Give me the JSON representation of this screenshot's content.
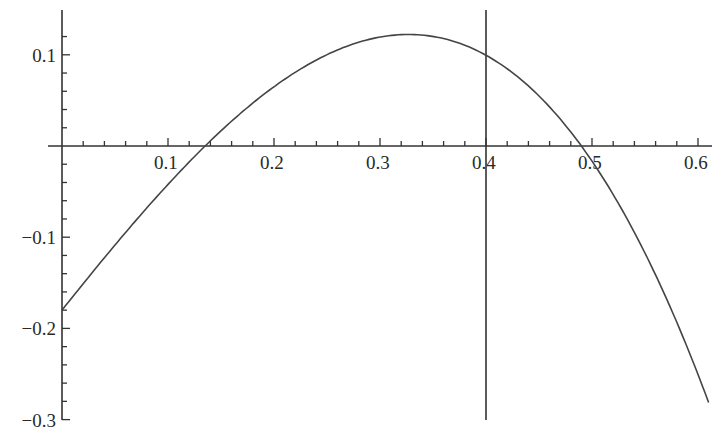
{
  "chart_data": {
    "type": "line",
    "title": "",
    "xlabel": "",
    "ylabel": "",
    "xlim": [
      0,
      0.61
    ],
    "ylim": [
      -0.3,
      0.13
    ],
    "grid": false,
    "legend": null,
    "x_ticks": [
      {
        "value": 0.1,
        "label": "0.1"
      },
      {
        "value": 0.2,
        "label": "0.2"
      },
      {
        "value": 0.3,
        "label": "0.3"
      },
      {
        "value": 0.4,
        "label": "0.4"
      },
      {
        "value": 0.5,
        "label": "0.5"
      },
      {
        "value": 0.6,
        "label": "0.6"
      }
    ],
    "y_ticks": [
      {
        "value": 0.1,
        "label": "0.1"
      },
      {
        "value": -0.1,
        "label": "−0.1"
      },
      {
        "value": -0.2,
        "label": "−0.2"
      },
      {
        "value": -0.3,
        "label": "−0.3"
      }
    ],
    "x_minor_step": 0.02,
    "y_minor_step": 0.02,
    "series": [
      {
        "name": "f(x)",
        "x": [
          0.0,
          0.05,
          0.1,
          0.135,
          0.15,
          0.2,
          0.25,
          0.3,
          0.32,
          0.35,
          0.4,
          0.45,
          0.49,
          0.5,
          0.55,
          0.61
        ],
        "values": [
          -0.18,
          -0.115,
          -0.055,
          0.0,
          0.015,
          0.062,
          0.092,
          0.104,
          0.105,
          0.103,
          0.088,
          0.05,
          0.0,
          -0.015,
          -0.09,
          -0.22
        ]
      }
    ],
    "annotations": [
      {
        "type": "vertical_line",
        "x": 0.4,
        "y_range": [
          -0.3,
          0.13
        ]
      }
    ],
    "features": {
      "y_intercept": -0.18,
      "roots": [
        0.135,
        0.49
      ],
      "maximum": {
        "x": 0.32,
        "y": 0.105
      }
    }
  }
}
